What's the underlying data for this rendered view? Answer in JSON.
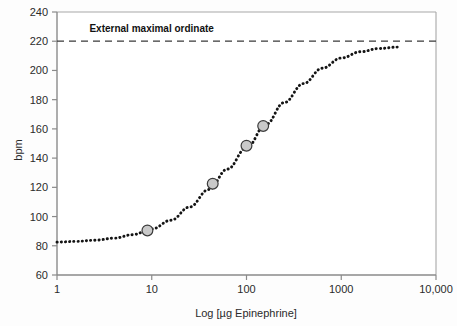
{
  "chart_data": {
    "type": "line",
    "title": "",
    "xlabel": "Log [µg Epinephrine]",
    "ylabel": "bpm",
    "xscale": "log",
    "xlim": [
      1,
      10000
    ],
    "ylim": [
      60,
      240
    ],
    "xticks": [
      1,
      10,
      100,
      1000,
      10000
    ],
    "xtick_labels": [
      "1",
      "10",
      "100",
      "1000",
      "10,000"
    ],
    "yticks": [
      60,
      80,
      100,
      120,
      140,
      160,
      180,
      200,
      220,
      240
    ],
    "ytick_labels": [
      "60",
      "80",
      "100",
      "120",
      "140",
      "160",
      "180",
      "200",
      "220",
      "240"
    ],
    "grid": false,
    "legend": null,
    "series": [
      {
        "name": "Epinephrine dose-response curve",
        "style": "dotted",
        "color": "#141414",
        "x": [
          1,
          1.6,
          2.5,
          4,
          6.3,
          10,
          16,
          25,
          40,
          63,
          100,
          160,
          250,
          400,
          630,
          1000,
          1600,
          2500,
          4000
        ],
        "y": [
          82.5,
          83.0,
          83.8,
          85.2,
          87.6,
          91.5,
          97.5,
          106.5,
          118.5,
          132.5,
          147.0,
          163.0,
          178.0,
          191.0,
          201.5,
          208.5,
          212.8,
          215.0,
          216.0
        ]
      }
    ],
    "points": [
      {
        "x": 9,
        "y": 90.5,
        "label": ""
      },
      {
        "x": 44,
        "y": 122.5,
        "label": ""
      },
      {
        "x": 100,
        "y": 148.5,
        "label": ""
      },
      {
        "x": 150,
        "y": 162.0,
        "label": ""
      }
    ],
    "reference_lines": [
      {
        "orientation": "horizontal",
        "y": 220,
        "style": "dashed",
        "color": "#3a3a3a",
        "label": "External maximal ordinate"
      }
    ],
    "annotations": [
      {
        "text": "External maximal ordinate",
        "x": 2.2,
        "y": 226,
        "bold": true
      }
    ],
    "colors": {
      "curve": "#141414",
      "marker_fill": "#c9c9c9",
      "marker_stroke": "#3c3c3c",
      "axis": "#8a8a8a",
      "text": "#2b2b2b",
      "background": "#fdfdfd"
    }
  }
}
